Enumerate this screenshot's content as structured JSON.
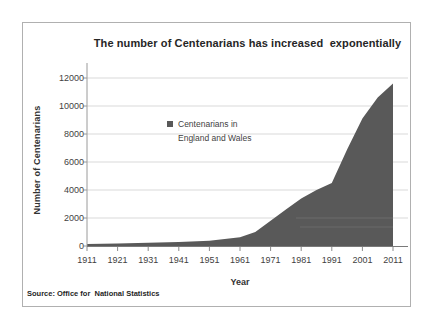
{
  "chart": {
    "title": "The number of Centenarians has increased  exponentially",
    "x_axis": {
      "label": "Year",
      "ticks": [
        "1911",
        "1921",
        "1931",
        "1941",
        "1951",
        "1961",
        "1971",
        "1981",
        "1991",
        "2001",
        "2011"
      ]
    },
    "y_axis": {
      "label": "Number of Centenarians",
      "ticks": [
        "12000",
        "10000",
        "8000",
        "6000",
        "4000",
        "2000",
        "0"
      ]
    },
    "legend": {
      "line1": "Centenarians in",
      "line2": "England and Wales",
      "marker_color": "#595959"
    },
    "source": "Source: Office for  National Statistics"
  },
  "colors": {
    "area_fill": "#595959",
    "gridline": "#d9d9d9",
    "axis_line": "#9a9a9a",
    "baseline": "#7a7a7a",
    "tick_mark": "#8c8c8c",
    "frame_border": "#b0b0b0",
    "tick_text": "#3f3f3f"
  },
  "chart_data": {
    "type": "area",
    "title": "The number of Centenarians has increased exponentially",
    "xlabel": "Year",
    "ylabel": "Number of Centenarians",
    "xlim": [
      1911,
      2011
    ],
    "ylim": [
      0,
      12000
    ],
    "y_tick_step": 2000,
    "grid": "horizontal",
    "legend_position": "inside-top-center",
    "x_ticks": [
      1911,
      1921,
      1931,
      1941,
      1951,
      1961,
      1971,
      1981,
      1991,
      2001,
      2011
    ],
    "y_ticks": [
      12000,
      10000,
      8000,
      6000,
      4000,
      2000,
      0
    ],
    "series": [
      {
        "name": "Centenarians in England and Wales",
        "color": "#595959",
        "x": [
          1911,
          1921,
          1931,
          1941,
          1951,
          1961,
          1966,
          1971,
          1976,
          1981,
          1986,
          1991,
          1996,
          2001,
          2006,
          2011
        ],
        "values": [
          150,
          180,
          230,
          290,
          380,
          620,
          1000,
          1800,
          2600,
          3400,
          4000,
          4500,
          6900,
          9100,
          10600,
          11600
        ]
      }
    ]
  }
}
